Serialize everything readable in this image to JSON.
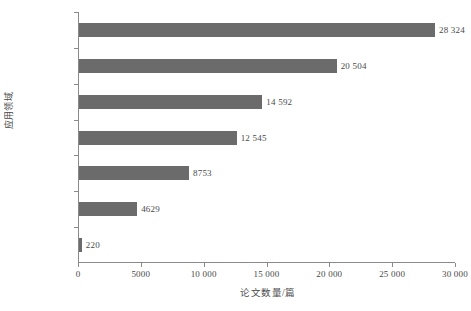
{
  "chart_data": {
    "type": "bar",
    "orientation": "horizontal",
    "title": "",
    "xlabel": "论文数量/篇",
    "ylabel": "应用领域",
    "xlim": [
      0,
      30000
    ],
    "grid": false,
    "legend": null,
    "bar_color": "#6b6b6b",
    "axis_color": "#8a8a8a",
    "categories": [
      "治疗",
      "病理",
      "流行病学",
      "诊断",
      "病因学",
      "预防",
      "康复"
    ],
    "values": [
      28324,
      20504,
      14592,
      12545,
      8753,
      4629,
      220
    ],
    "value_labels": [
      "28 324",
      "20 504",
      "14 592",
      "12 545",
      "8753",
      "4629",
      "220"
    ],
    "xticks": [
      0,
      5000,
      10000,
      15000,
      20000,
      25000,
      30000
    ],
    "xtick_labels": [
      "0",
      "5000",
      "10 000",
      "15 000",
      "20 000",
      "25 000",
      "30 000"
    ]
  }
}
